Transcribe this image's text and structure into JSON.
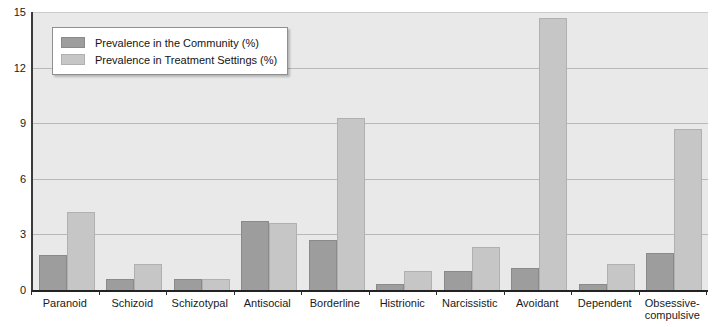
{
  "chart_data": {
    "type": "bar",
    "title": "",
    "xlabel": "",
    "ylabel": "",
    "ylim": [
      0,
      15
    ],
    "yticks": [
      "0",
      "3",
      "6",
      "9",
      "12",
      "15"
    ],
    "grid": true,
    "legend_position": "top-left",
    "categories": [
      "Paranoid",
      "Schizoid",
      "Schizotypal",
      "Antisocial",
      "Borderline",
      "Histrionic",
      "Narcissistic",
      "Avoidant",
      "Dependent",
      "Obsessive-compulsive"
    ],
    "series": [
      {
        "name": "Prevalence in the Community (%)",
        "color": "#9d9d9d",
        "values": [
          1.9,
          0.6,
          0.6,
          3.7,
          2.7,
          0.3,
          1.0,
          1.2,
          0.3,
          2.0
        ]
      },
      {
        "name": "Prevalence in Treatment Settings (%)",
        "color": "#c6c6c6",
        "values": [
          4.2,
          1.4,
          0.6,
          3.6,
          9.3,
          1.0,
          2.3,
          14.7,
          1.4,
          8.7
        ]
      }
    ]
  },
  "legend": {
    "items": [
      {
        "label": "Prevalence in the Community (%)",
        "swatch": "community"
      },
      {
        "label": "Prevalence in Treatment Settings (%)",
        "swatch": "treatment"
      }
    ]
  },
  "colors": {
    "plot_background": "#e9e9e9",
    "gridline": "#b9b9b9",
    "axis": "#222222",
    "community_bar": "#9d9d9d",
    "treatment_bar": "#c6c6c6"
  }
}
